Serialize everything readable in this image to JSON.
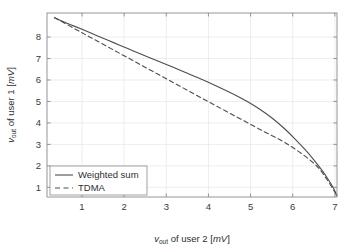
{
  "chart_data": {
    "type": "line",
    "title": "",
    "xlabel": "v_out of user 2 [mV]",
    "ylabel": "v_out of user 1 [mV]",
    "xlabel_parts": {
      "var": "v",
      "sub": "out",
      "mid": " of user 2 [",
      "unit": "mV",
      "end": "]"
    },
    "ylabel_parts": {
      "var": "v",
      "sub": "out",
      "mid": " of user 1 [",
      "unit": "mV",
      "end": "]"
    },
    "xlim": [
      0.17,
      7.05
    ],
    "ylim": [
      0.55,
      9.12
    ],
    "xticks": [
      1,
      2,
      3,
      4,
      5,
      6,
      7
    ],
    "xticklabels": [
      "1",
      "2",
      "3",
      "4",
      "5",
      "6",
      "7"
    ],
    "yticks": [
      1,
      2,
      3,
      4,
      5,
      6,
      7,
      8
    ],
    "yticklabels": [
      "1",
      "2",
      "3",
      "4",
      "5",
      "6",
      "7",
      "8"
    ],
    "grid": true,
    "legend_position": "lower left",
    "series": [
      {
        "name": "Weighted sum",
        "style": "solid",
        "color": "#4d4d4d",
        "points": [
          [
            0.35,
            8.9
          ],
          [
            0.55,
            8.72
          ],
          [
            0.8,
            8.52
          ],
          [
            1.1,
            8.28
          ],
          [
            1.4,
            8.03
          ],
          [
            1.75,
            7.74
          ],
          [
            2.1,
            7.45
          ],
          [
            2.45,
            7.16
          ],
          [
            2.8,
            6.88
          ],
          [
            3.15,
            6.6
          ],
          [
            3.5,
            6.31
          ],
          [
            3.85,
            6.02
          ],
          [
            4.2,
            5.71
          ],
          [
            4.55,
            5.38
          ],
          [
            4.9,
            5.02
          ],
          [
            5.2,
            4.66
          ],
          [
            5.5,
            4.24
          ],
          [
            5.8,
            3.74
          ],
          [
            6.05,
            3.26
          ],
          [
            6.3,
            2.74
          ],
          [
            6.5,
            2.28
          ],
          [
            6.7,
            1.78
          ],
          [
            6.85,
            1.34
          ],
          [
            6.97,
            0.95
          ],
          [
            7.05,
            0.6
          ]
        ]
      },
      {
        "name": "TDMA",
        "style": "dashed",
        "color": "#4d4d4d",
        "points": [
          [
            0.35,
            8.9
          ],
          [
            1.0,
            8.2
          ],
          [
            1.7,
            7.45
          ],
          [
            2.4,
            6.7
          ],
          [
            3.1,
            5.95
          ],
          [
            3.8,
            5.2
          ],
          [
            4.5,
            4.46
          ],
          [
            5.2,
            3.72
          ],
          [
            5.9,
            2.98
          ],
          [
            6.5,
            2.12
          ],
          [
            6.8,
            1.4
          ],
          [
            7.05,
            0.6
          ]
        ]
      }
    ]
  },
  "legend": {
    "items": [
      {
        "label": "Weighted sum",
        "style": "solid"
      },
      {
        "label": "TDMA",
        "style": "dashed"
      }
    ]
  },
  "colors": {
    "axis": "#8a8a8a",
    "grid": "#e8e8e8",
    "line": "#4d4d4d",
    "text": "#2e2e2e",
    "background": "#ffffff"
  }
}
